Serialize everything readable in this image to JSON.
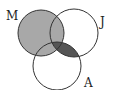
{
  "diagram": {
    "type": "venn",
    "sets": [
      {
        "label": "M",
        "cx": 41,
        "cy": 33,
        "r": 23
      },
      {
        "label": "J",
        "cx": 74,
        "cy": 33,
        "r": 24
      },
      {
        "label": "A",
        "cx": 57,
        "cy": 66,
        "r": 24
      }
    ],
    "shaded_regions": [
      {
        "region": "M",
        "color": "#a8a8a8"
      },
      {
        "region": "J∩A",
        "color": "#555555"
      }
    ],
    "colors": {
      "outline": "#333333",
      "light_shade": "#a8a8a8",
      "dark_shade": "#555555",
      "overlap_shade": "#4a4a4a"
    }
  }
}
